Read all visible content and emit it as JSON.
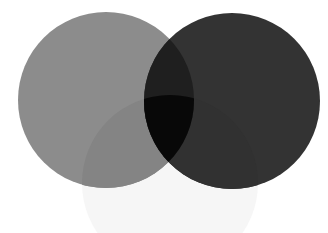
{
  "diagram": {
    "type": "venn",
    "sets": 3,
    "canvas": {
      "width": 328,
      "height": 233,
      "background": "#ffffff"
    },
    "circles": [
      {
        "id": "left",
        "cx": 106,
        "cy": 100,
        "r": 88,
        "color": "#8c8c8c"
      },
      {
        "id": "right",
        "cx": 232,
        "cy": 101,
        "r": 88,
        "color": "#333333"
      },
      {
        "id": "bottom",
        "cx": 170,
        "cy": 183,
        "r": 88,
        "color": "#f6f6f6"
      }
    ],
    "regions": {
      "left_only": "#8c8c8c",
      "right_only": "#333333",
      "bottom_only": "#f6f6f6",
      "left_bottom": "#848484",
      "right_bottom": "#313131",
      "left_right": "#1f1f1f",
      "left_right_bottom": "#080808"
    },
    "labels": []
  }
}
